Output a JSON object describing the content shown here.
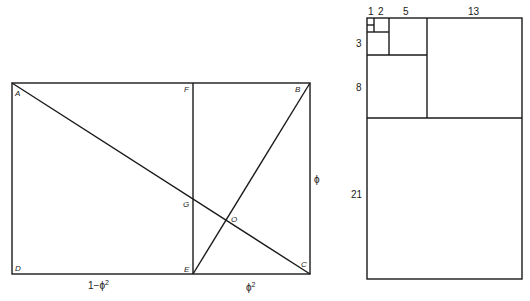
{
  "left_figure": {
    "points": {
      "A": "A",
      "B": "B",
      "C": "C",
      "D": "D",
      "E": "E",
      "F": "F",
      "G": "G",
      "O": "O"
    },
    "dimensions": {
      "bottom_left": "1−ϕ",
      "bottom_left_exp": "2",
      "bottom_right": "ϕ",
      "bottom_right_exp": "2",
      "right_side": "ϕ"
    }
  },
  "right_figure": {
    "labels": {
      "one": "1",
      "two": "2",
      "three": "3",
      "five": "5",
      "eight": "8",
      "thirteen": "13",
      "twentyone": "21"
    }
  }
}
